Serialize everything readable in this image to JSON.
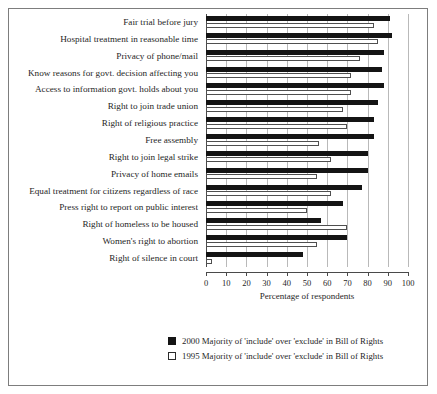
{
  "chart_data": {
    "type": "bar",
    "orientation": "horizontal",
    "title": "",
    "xlabel": "Percentage of respondents",
    "ylabel": "",
    "xlim": [
      0,
      100
    ],
    "xticks": [
      0,
      10,
      20,
      30,
      40,
      50,
      60,
      70,
      80,
      90,
      100
    ],
    "grid": true,
    "legend_position": "bottom-center",
    "categories": [
      "Fair trial before jury",
      "Hospital treatment in reasonable time",
      "Privacy of phone/mail",
      "Know reasons for govt. decision affecting you",
      "Access to information govt. holds about you",
      "Right to join trade union",
      "Right of religious practice",
      "Free assembly",
      "Right to join legal strike",
      "Privacy of home emails",
      "Equal treatment for citizens regardless of race",
      "Press right to report on public interest",
      "Right of homeless to be housed",
      "Women's right to abortion",
      "Right of silence in court"
    ],
    "series": [
      {
        "name": "2000 Majority of 'include' over 'exclude' in Bill of Rights",
        "color": "#141414",
        "style": "filled",
        "values": [
          91,
          92,
          88,
          87,
          88,
          85,
          83,
          83,
          80,
          80,
          77,
          68,
          57,
          70,
          48
        ]
      },
      {
        "name": "1995 Majority of 'include' over 'exclude' in Bill of Rights",
        "color": "#ffffff",
        "style": "hollow",
        "values": [
          83,
          85,
          76,
          72,
          72,
          68,
          70,
          56,
          62,
          55,
          62,
          50,
          70,
          55,
          3
        ]
      }
    ]
  },
  "legend": {
    "items": [
      {
        "label": "2000 Majority of 'include' over 'exclude' in Bill of Rights",
        "style": "filled"
      },
      {
        "label": "1995 Majority of 'include' over 'exclude' in Bill of Rights",
        "style": "hollow"
      }
    ]
  }
}
